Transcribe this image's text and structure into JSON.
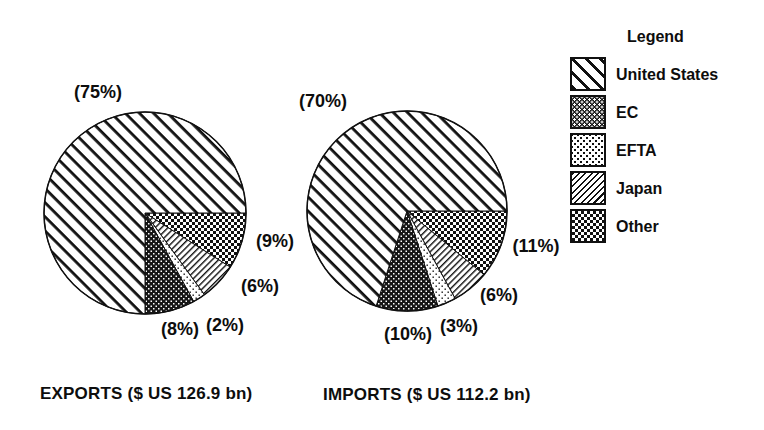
{
  "figure": {
    "background": "#ffffff",
    "text_color": "#0d0d0d"
  },
  "legend": {
    "title": "Legend",
    "items": [
      {
        "key": "us",
        "label": "United States",
        "pattern": "wide-backslash-hatch"
      },
      {
        "key": "ec",
        "label": "EC",
        "pattern": "dark-with-white-dots"
      },
      {
        "key": "efta",
        "label": "EFTA",
        "pattern": "light-black-dots"
      },
      {
        "key": "japan",
        "label": "Japan",
        "pattern": "thin-slash-hatch"
      },
      {
        "key": "other",
        "label": "Other",
        "pattern": "checkerboard"
      }
    ]
  },
  "chart_data": [
    {
      "type": "pie",
      "title": "EXPORTS ($ US 126.9 bn)",
      "total_value_bn_usd": 126.9,
      "start_angle_deg": 0,
      "direction": "counterclockwise",
      "series": [
        {
          "key": "us",
          "name": "United States",
          "value": 75,
          "label": "(75%)"
        },
        {
          "key": "ec",
          "name": "EC",
          "value": 8,
          "label": "(8%)"
        },
        {
          "key": "efta",
          "name": "EFTA",
          "value": 2,
          "label": "(2%)"
        },
        {
          "key": "japan",
          "name": "Japan",
          "value": 6,
          "label": "(6%)"
        },
        {
          "key": "other",
          "name": "Other",
          "value": 9,
          "label": "(9%)"
        }
      ]
    },
    {
      "type": "pie",
      "title": "IMPORTS ($ US 112.2 bn)",
      "total_value_bn_usd": 112.2,
      "start_angle_deg": 0,
      "direction": "counterclockwise",
      "series": [
        {
          "key": "us",
          "name": "United States",
          "value": 70,
          "label": "(70%)"
        },
        {
          "key": "ec",
          "name": "EC",
          "value": 10,
          "label": "(10%)"
        },
        {
          "key": "efta",
          "name": "EFTA",
          "value": 3,
          "label": "(3%)"
        },
        {
          "key": "japan",
          "name": "Japan",
          "value": 6,
          "label": "(6%)"
        },
        {
          "key": "other",
          "name": "Other",
          "value": 11,
          "label": "(11%)"
        }
      ]
    }
  ]
}
